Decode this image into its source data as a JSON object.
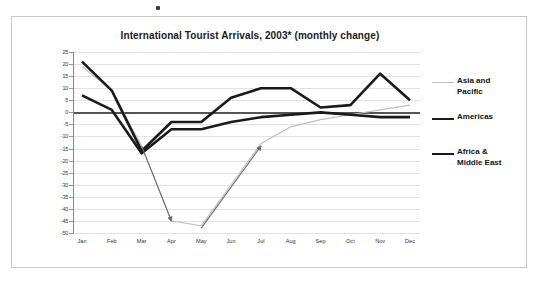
{
  "chart_data": {
    "type": "line",
    "title": "International Tourist Arrivals, 2003* (monthly change)",
    "xlabel": "",
    "ylabel": "",
    "ylim": [
      -50,
      25
    ],
    "ytick_step": 5,
    "grid": true,
    "legend_position": "right",
    "categories": [
      "Jan",
      "Feb",
      "Mar",
      "Apr",
      "May",
      "Jun",
      "Jul",
      "Aug",
      "Sep",
      "Oct",
      "Nov",
      "Dec"
    ],
    "yticks": [
      "25",
      "20",
      "15",
      "10",
      "5",
      "0",
      "-5",
      "-10",
      "-15",
      "-20",
      "-25",
      "-30",
      "-35",
      "-40",
      "-45",
      "-50"
    ],
    "series": [
      {
        "name": "Asia and Pacific",
        "color": "#bfbfbf",
        "width": 1.2,
        "values": [
          19,
          9,
          -14,
          -45,
          -47,
          -30,
          -13,
          -6,
          -3,
          -1,
          1,
          3
        ]
      },
      {
        "name": "Americas",
        "color": "#1a1a1a",
        "width": 2.6,
        "values": [
          7,
          1,
          -17,
          -7,
          -7,
          -4,
          -2,
          -1,
          0,
          -1,
          -2,
          -2
        ]
      },
      {
        "name": "Africa & Middle East",
        "color": "#1a1a1a",
        "width": 2.6,
        "values": [
          21,
          9,
          -16,
          -4,
          -4,
          6,
          10,
          10,
          2,
          3,
          16,
          5
        ]
      }
    ],
    "annotations": [
      {
        "name": "decline-arrow",
        "label": "",
        "from": {
          "x": "Mar",
          "y": -14
        },
        "to": {
          "x": "Apr",
          "y": -45
        },
        "color": "#6b6b6b"
      },
      {
        "name": "recovery-arrow",
        "label": "",
        "from": {
          "x": "May",
          "y": -48
        },
        "to": {
          "x": "Jul",
          "y": -14
        },
        "color": "#6b6b6b"
      }
    ]
  },
  "legend": {
    "entries": [
      {
        "label": "Asia and\nPacific",
        "color": "#bfbfbf",
        "weight": "thin"
      },
      {
        "label": "Americas",
        "color": "#1a1a1a",
        "weight": "thick"
      },
      {
        "label": "Africa &\nMiddle East",
        "color": "#1a1a1a",
        "weight": "thick"
      }
    ]
  }
}
